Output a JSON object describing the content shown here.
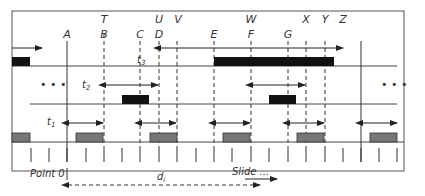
{
  "diagram": {
    "top_labels": [
      {
        "text": "T",
        "x": 104
      },
      {
        "text": "U",
        "x": 159
      },
      {
        "text": "V",
        "x": 177
      },
      {
        "text": "W",
        "x": 251
      },
      {
        "text": "X",
        "x": 306
      },
      {
        "text": "Y",
        "x": 325
      },
      {
        "text": "Z",
        "x": 343
      }
    ],
    "point_labels": [
      {
        "text": "A",
        "x": 67
      },
      {
        "text": "B",
        "x": 104
      },
      {
        "text": "C",
        "x": 140
      },
      {
        "text": "D",
        "x": 159
      },
      {
        "text": "E",
        "x": 214
      },
      {
        "text": "F",
        "x": 251
      },
      {
        "text": "G",
        "x": 288
      }
    ],
    "interval_labels": {
      "t1": "t",
      "t1_sub": "1",
      "t2": "t",
      "t2_sub": "2",
      "t3": "t",
      "t3_sub": "3",
      "d": "d",
      "d_sub": "i"
    },
    "ellipsis_left": "• • •",
    "ellipsis_right": "• • •",
    "point0_label": "Point 0",
    "slide_label": "Slide ...",
    "colors": {
      "border": "#555555",
      "line": "#444444",
      "black_bar": "#111111",
      "gray_bar": "#777777",
      "gray_bar_border": "#333333"
    }
  }
}
